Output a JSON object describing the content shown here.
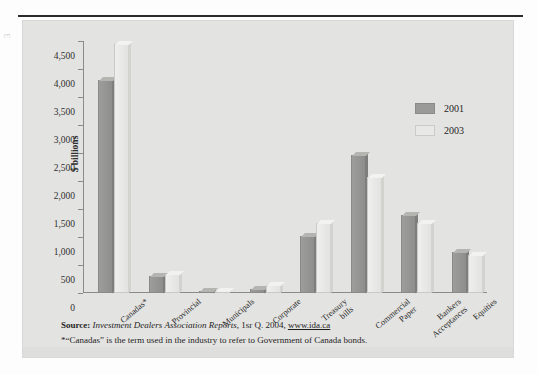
{
  "page": {
    "margin_mark": "3"
  },
  "figure": {
    "legend": {
      "entries": [
        {
          "label": "2001",
          "color": "#9a9a98"
        },
        {
          "label": "2003",
          "color": "#e8e8e6"
        }
      ]
    },
    "source": {
      "label": "Source:",
      "publication": "Investment Dealers Association Reports",
      "detail": ", 1sr Q. 2004, ",
      "url": "www.ida.ca",
      "footnote": "*“Canadas” is the term used in the industry to refer to Government of Canada bonds."
    }
  },
  "chart_data": {
    "type": "bar",
    "title": "",
    "xlabel": "",
    "ylabel": "$ billions",
    "ylim": [
      0,
      4500
    ],
    "yticks": [
      0,
      500,
      1000,
      1500,
      2000,
      2500,
      3000,
      3500,
      4000,
      4500
    ],
    "ytick_labels": [
      "0",
      "500",
      "1,000",
      "1,500",
      "2,000",
      "2,500",
      "3,000",
      "3,500",
      "4,000",
      "4,500"
    ],
    "grid": false,
    "legend_position": "right",
    "categories": [
      "Canadas*",
      "Provincial",
      "Municipals",
      "Corporate",
      "Treasury\nbills",
      "Commercial\nPaper",
      "Bankers\nAcceptances",
      "Equities"
    ],
    "category_lines": [
      [
        "Canadas*"
      ],
      [
        "Provincial"
      ],
      [
        "Municipals"
      ],
      [
        "Corporate"
      ],
      [
        "Treasury",
        "bills"
      ],
      [
        "Commercial",
        "Paper"
      ],
      [
        "Bankers",
        "Acceptances"
      ],
      [
        "Equities"
      ]
    ],
    "series": [
      {
        "name": "2001",
        "color": "#9a9a98",
        "values": [
          3800,
          300,
          20,
          80,
          1010,
          2470,
          1400,
          730
        ]
      },
      {
        "name": "2003",
        "color": "#e8e8e6",
        "values": [
          4450,
          340,
          40,
          150,
          1250,
          2070,
          1250,
          680
        ]
      }
    ]
  }
}
